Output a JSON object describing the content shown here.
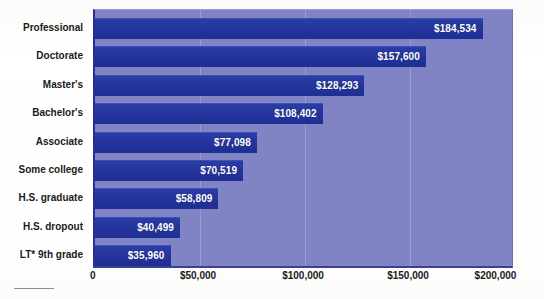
{
  "chart_data": {
    "type": "bar",
    "orientation": "horizontal",
    "title": "",
    "subtitle": "",
    "xlabel": "",
    "ylabel": "",
    "xlim": [
      0,
      200000
    ],
    "grid": true,
    "legend": null,
    "categories": [
      "Professional",
      "Doctorate",
      "Master's",
      "Bachelor's",
      "Associate",
      "Some college",
      "H.S. graduate",
      "H.S. dropout",
      "LT* 9th grade"
    ],
    "values": [
      184534,
      157600,
      128293,
      108402,
      77098,
      70519,
      58809,
      40499,
      35960
    ],
    "value_labels": [
      "$184,534",
      "$157,600",
      "$128,293",
      "$108,402",
      "$77,098",
      "$70,519",
      "$58,809",
      "$40,499",
      "$35,960"
    ],
    "xticks": [
      0,
      50000,
      100000,
      150000,
      200000
    ],
    "xtick_labels": [
      "0",
      "$50,000",
      "$100,000",
      "$150,000",
      "$200,000"
    ],
    "colors": {
      "bar": "#23329a",
      "plot_background": "#8084c4",
      "plot_border": "#27318d",
      "value_label_text": "#ffffff",
      "axis_text": "#1a1a1a",
      "page_background": "#ffffff"
    }
  },
  "footnote": {
    "rule": ""
  }
}
